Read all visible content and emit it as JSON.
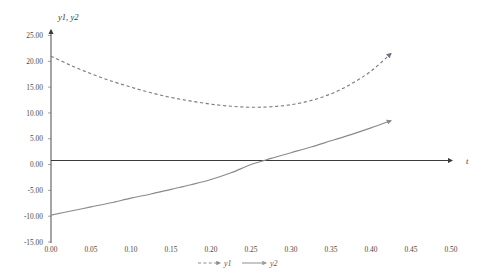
{
  "chart_data": {
    "type": "line",
    "title": "",
    "xlabel": "t",
    "ylabel": "y1, y2",
    "xlim": [
      0.0,
      0.5
    ],
    "ylim": [
      -15.0,
      25.0
    ],
    "grid": false,
    "legend_position": "bottom",
    "xticks": [
      "0.00",
      "0.05",
      "0.10",
      "0.15",
      "0.20",
      "0.25",
      "0.30",
      "0.35",
      "0.40",
      "0.45",
      "0.50"
    ],
    "xtick_values": [
      0.0,
      0.05,
      0.1,
      0.15,
      0.2,
      0.25,
      0.3,
      0.35,
      0.4,
      0.45,
      0.5
    ],
    "yticks": [
      "25.00",
      "20.00",
      "15.00",
      "10.00",
      "5.00",
      "0.00",
      "-5.00",
      "-10.00",
      "-15.00"
    ],
    "ytick_values": [
      25,
      20,
      15,
      10,
      5,
      0,
      -5,
      -10,
      -15
    ],
    "series": [
      {
        "name": "y1",
        "style": "dashed",
        "color": "#7a7a8c",
        "arrow_end": true,
        "x": [
          0.0,
          0.025,
          0.05,
          0.075,
          0.1,
          0.125,
          0.15,
          0.175,
          0.2,
          0.225,
          0.25,
          0.275,
          0.3,
          0.325,
          0.35,
          0.375,
          0.4,
          0.425
        ],
        "values": [
          21.0,
          19.2,
          17.6,
          16.2,
          15.0,
          13.9,
          13.0,
          12.3,
          11.7,
          11.3,
          11.1,
          11.2,
          11.6,
          12.4,
          13.7,
          15.6,
          18.1,
          21.5
        ]
      },
      {
        "name": "y2",
        "style": "solid",
        "color": "#8a8a8a",
        "arrow_end": true,
        "x": [
          0.0,
          0.025,
          0.05,
          0.075,
          0.1,
          0.125,
          0.15,
          0.175,
          0.2,
          0.225,
          0.25,
          0.275,
          0.3,
          0.325,
          0.35,
          0.375,
          0.4,
          0.425
        ],
        "values": [
          -9.8,
          -9.0,
          -8.2,
          -7.4,
          -6.5,
          -5.7,
          -4.8,
          -3.9,
          -2.9,
          -1.6,
          0.0,
          1.2,
          2.3,
          3.4,
          4.6,
          5.8,
          7.1,
          8.5
        ]
      }
    ]
  },
  "axes": {
    "x_title": "t",
    "y_title": "y1, y2",
    "x_axis_color": "#3a3a3a",
    "y_axis_color": "#5a5a5a"
  },
  "legend": {
    "items": [
      {
        "label": "y1",
        "style": "dashed"
      },
      {
        "label": "y2",
        "style": "solid"
      }
    ]
  }
}
